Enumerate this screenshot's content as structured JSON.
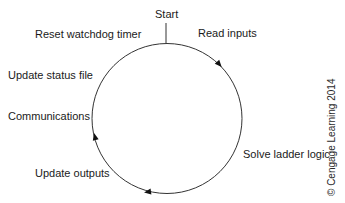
{
  "diagram": {
    "start_label": "Start",
    "direction": "clockwise",
    "steps": [
      {
        "label": "Read inputs"
      },
      {
        "label": "Solve ladder logic"
      },
      {
        "label": "Update outputs"
      },
      {
        "label": "Communications"
      },
      {
        "label": "Update status file"
      },
      {
        "label": "Reset watchdog timer"
      }
    ],
    "copyright": "© Cengage Learning 2014",
    "colors": {
      "line": "#333333",
      "text": "#1a1a1a",
      "background": "#ffffff"
    }
  }
}
